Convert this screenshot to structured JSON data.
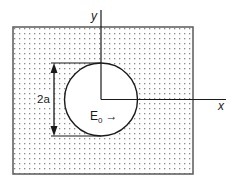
{
  "diagram": {
    "labels": {
      "y_axis": "y",
      "x_axis": "x",
      "diameter": "2a",
      "field_symbol": "E",
      "field_subscript": "0",
      "field_arrow": "→"
    },
    "colors": {
      "line": "#1a1a1a",
      "border": "#5a5a5a",
      "dots": "#8a8a8a",
      "background": "#ffffff"
    },
    "geometry": {
      "rect": {
        "x": 13,
        "y": 27,
        "width": 180,
        "height": 147
      },
      "circle": {
        "cx": 101,
        "cy": 99.5,
        "r": 36.5
      },
      "y_axis": {
        "x": 101,
        "y1": 10,
        "y2": 99.5
      },
      "x_axis": {
        "y": 99.5,
        "x1": 101,
        "x2": 226
      },
      "diameter_arrow": {
        "x": 54,
        "y1": 63,
        "y2": 136
      }
    }
  }
}
